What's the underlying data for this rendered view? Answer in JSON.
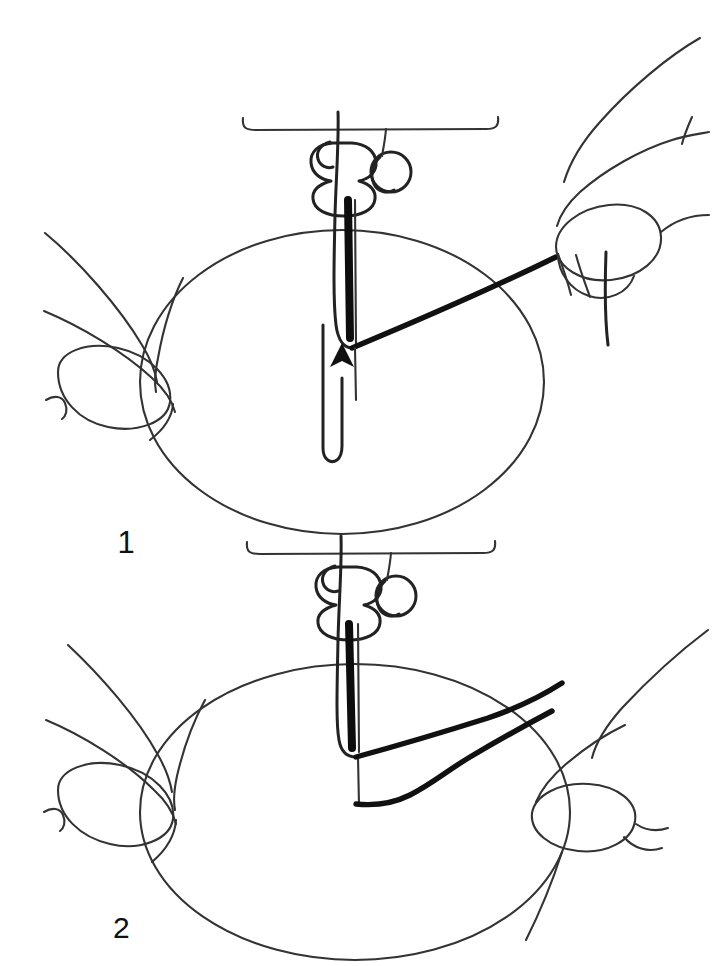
{
  "document": {
    "kind": "instructional-line-drawing",
    "title": "Punch needle threading steps",
    "background_color": "#ffffff",
    "ink_color": "#111111",
    "width": 713,
    "height": 966
  },
  "panels": [
    {
      "id": "panel-1",
      "step_number": "1",
      "label_position": {
        "x": 126,
        "y": 545
      },
      "description": "Needle punched through fabric, thread pulled taut to the right hand, arrow shows needle moving up",
      "elements": {
        "fabric_ellipse": {
          "cx": 342,
          "cy": 382,
          "rx": 202,
          "ry": 152
        },
        "machine_bed_bracket": {
          "y": 128,
          "x_start": 243,
          "x_end": 497
        },
        "needle_tip": {
          "x": 352,
          "y": 350
        },
        "arrow_direction": "up",
        "arrow_label": "needle-motion-arrow",
        "thread_state": "taut",
        "hands": [
          "left-hand",
          "right-hand-holding-thread"
        ]
      }
    },
    {
      "id": "panel-2",
      "step_number": "2",
      "label_position": {
        "x": 113,
        "y": 927
      },
      "description": "Needle through fabric with slack wavy thread running to the right hand",
      "elements": {
        "fabric_ellipse": {
          "cx": 355,
          "cy": 812,
          "rx": 215,
          "ry": 148
        },
        "machine_bed_bracket": {
          "y": 552,
          "x_start": 247,
          "x_end": 495
        },
        "needle_tip": {
          "x": 356,
          "y": 800
        },
        "thread_state": "slack-wavy",
        "hands": [
          "left-hand",
          "right-hand"
        ]
      }
    }
  ],
  "icons": {
    "arrow_up": "arrow-up-icon",
    "needle": "needle-icon",
    "presser_foot": "presser-foot-icon",
    "thread": "thread-icon",
    "hand": "hand-icon",
    "fabric": "fabric-icon"
  }
}
